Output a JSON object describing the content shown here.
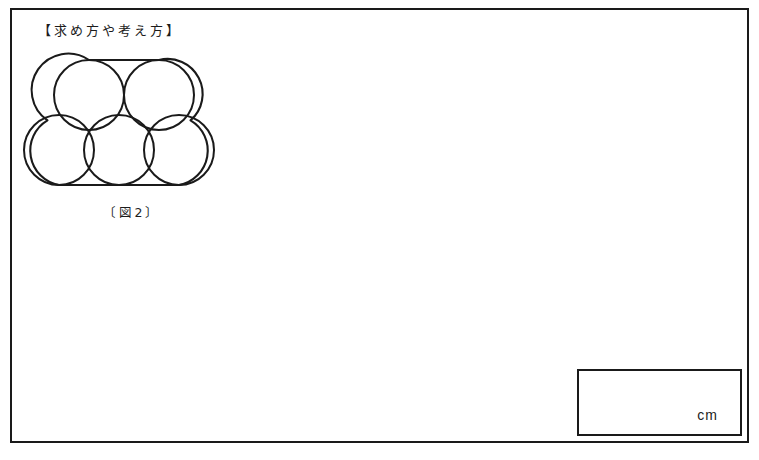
{
  "sheet": {
    "section_heading": "【求め方や考え方】",
    "background_color": "#ffffff",
    "border_color": "#1a1a1a"
  },
  "figure": {
    "caption": "〔図2〕",
    "stroke_color": "#1a1a1a",
    "circle_count": 5,
    "bottom_row_count": 3,
    "top_row_count": 2,
    "circle_radius_px": 35,
    "circles": [
      {
        "name": "bottom-left-circle",
        "cx": 45,
        "cy": 100,
        "r": 35
      },
      {
        "name": "bottom-center-circle",
        "cx": 105,
        "cy": 100,
        "r": 35
      },
      {
        "name": "bottom-right-circle",
        "cx": 165,
        "cy": 100,
        "r": 35
      },
      {
        "name": "top-left-circle",
        "cx": 75,
        "cy": 45,
        "r": 35
      },
      {
        "name": "top-right-circle",
        "cx": 145,
        "cy": 45,
        "r": 35
      }
    ]
  },
  "answer_box": {
    "value": "",
    "placeholder": "",
    "unit_label": "cm"
  }
}
